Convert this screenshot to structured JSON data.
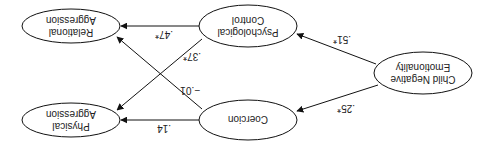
{
  "diagram": {
    "orientation": "rotated 180 degrees",
    "nodes": [
      {
        "id": "cne",
        "lines": [
          "Child Negative",
          "Emotionality"
        ]
      },
      {
        "id": "pc",
        "lines": [
          "Psychological",
          "Control"
        ]
      },
      {
        "id": "co",
        "lines": [
          "Coercion"
        ]
      },
      {
        "id": "ra",
        "lines": [
          "Relational",
          "Aggression"
        ]
      },
      {
        "id": "pa",
        "lines": [
          "Physical",
          "Aggression"
        ]
      }
    ],
    "edges": [
      {
        "from": "cne",
        "to": "pc",
        "label": ".51*"
      },
      {
        "from": "cne",
        "to": "co",
        "label": ".25*"
      },
      {
        "from": "pc",
        "to": "ra",
        "label": ".47*"
      },
      {
        "from": "pc",
        "to": "pa",
        "label": ".37*"
      },
      {
        "from": "co",
        "to": "ra",
        "label": "−.01"
      },
      {
        "from": "co",
        "to": "pa",
        "label": ".14"
      }
    ]
  }
}
